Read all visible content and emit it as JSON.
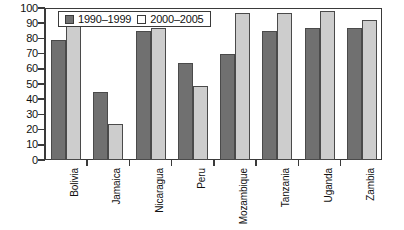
{
  "chart_data": {
    "type": "bar",
    "title": "",
    "subtitle": "",
    "xlabel": "",
    "ylabel": "",
    "ylim": [
      0,
      100
    ],
    "yticks": [
      0,
      10,
      20,
      30,
      40,
      50,
      60,
      70,
      80,
      90,
      100
    ],
    "grid": false,
    "legend_position": "top-left",
    "categories": [
      "Bolivia",
      "Jamaica",
      "Nicaragua",
      "Peru",
      "Mozambique",
      "Tanzania",
      "Uganda",
      "Zambia"
    ],
    "series": [
      {
        "name": "1990–1999",
        "color": "#707070",
        "values": [
          79,
          45,
          85,
          64,
          70,
          85,
          87,
          87
        ]
      },
      {
        "name": "2000–2005",
        "color": "#cdcdcd",
        "values": [
          89,
          24,
          87,
          49,
          97,
          97,
          98,
          92
        ]
      }
    ]
  },
  "legend": {
    "items": [
      {
        "label": "1990–1999",
        "swatch": "dark-gray-swatch-icon"
      },
      {
        "label": "2000–2005",
        "swatch": "light-gray-swatch-icon"
      }
    ]
  },
  "colors": {
    "series_1990_1999": "#707070",
    "series_2000_2005": "#cdcdcd",
    "axis": "#3a3a3a",
    "background": "#ffffff"
  }
}
